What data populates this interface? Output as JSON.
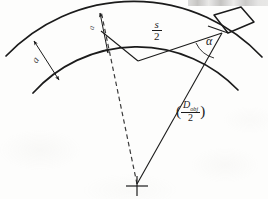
{
  "figure": {
    "background_color": "#fdfdfc",
    "line_color": "#1b1b1b",
    "width": 268,
    "height": 199
  },
  "labels": {
    "chord_half": {
      "numerator": "s",
      "denominator": "2",
      "name": "s/2"
    },
    "angle": {
      "symbol": "α",
      "name": "alpha"
    },
    "radius": {
      "open_paren": "(",
      "close_paren": ")",
      "numerator_base": "D",
      "numerator_sub": "obj",
      "denominator": "2",
      "name": "(D_obj/2)"
    },
    "depth_left": {
      "text": "a",
      "name": "a"
    },
    "depth_mid": {
      "text": "a",
      "name": "a"
    }
  },
  "geometry": {
    "center_point": {
      "x": 137,
      "y": 184,
      "marker": "cross"
    },
    "outer_arc": {
      "radius": 176,
      "description": "outer circular arc of workpiece"
    },
    "inner_arc": {
      "radius": 140,
      "description": "inner circular arc after cut"
    },
    "dashed_radius": {
      "description": "dashed center line from center to outer arc"
    },
    "solid_radius": {
      "description": "solid radius line from center to tool contact point"
    },
    "tool": {
      "shape": "parallelogram",
      "description": "cutting tool at top right"
    },
    "dimension_arrows": [
      {
        "name": "depth-arrow-left",
        "style": "double-headed"
      },
      {
        "name": "depth-arrow-mid",
        "style": "double-headed"
      }
    ],
    "angle_arc": {
      "description": "arc marking angle alpha at tool contact point"
    }
  },
  "header_artifact": {
    "description": "partial scanned text cut off at top edge"
  }
}
